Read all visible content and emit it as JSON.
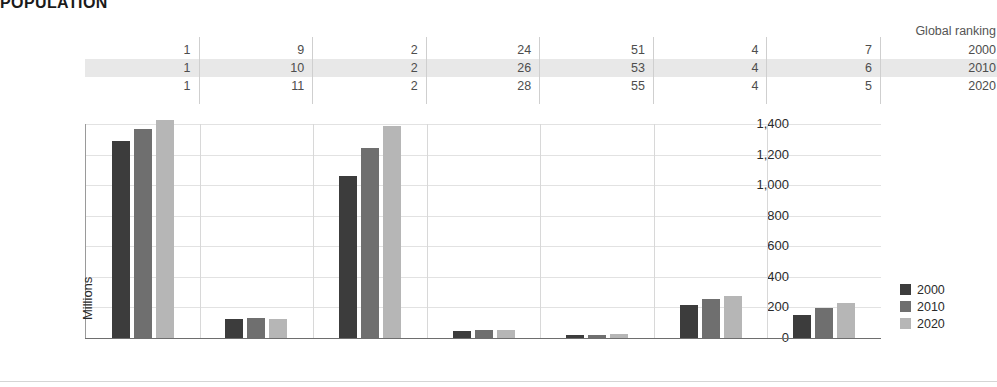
{
  "title": "POPULATION",
  "ranking_table": {
    "header_label": "Global ranking",
    "row_years": [
      "2000",
      "2010",
      "2020"
    ],
    "rows": [
      {
        "year": "2000",
        "values": [
          "1",
          "9",
          "2",
          "24",
          "51",
          "4",
          "7"
        ]
      },
      {
        "year": "2010",
        "values": [
          "1",
          "10",
          "2",
          "26",
          "53",
          "4",
          "6"
        ]
      },
      {
        "year": "2020",
        "values": [
          "1",
          "11",
          "2",
          "28",
          "55",
          "4",
          "5"
        ]
      }
    ],
    "highlighted_row_index": 1
  },
  "legend": {
    "position": "right",
    "items": [
      {
        "label": "2000",
        "color": "#3c3c3c"
      },
      {
        "label": "2010",
        "color": "#6f6f6f"
      },
      {
        "label": "2020",
        "color": "#b6b6b6"
      }
    ]
  },
  "chart_data": {
    "type": "bar",
    "title": "POPULATION",
    "xlabel": "",
    "ylabel": "Millions",
    "ylim": [
      0,
      1400
    ],
    "yticks": [
      "0",
      "200",
      "400",
      "600",
      "800",
      "1,000",
      "1,200",
      "1,400"
    ],
    "ytick_values": [
      0,
      200,
      400,
      600,
      800,
      1000,
      1200,
      1400
    ],
    "grid": true,
    "categories": [
      "China",
      "Japan",
      "India",
      "South Korea",
      "Australia",
      "Indonesia",
      "Pakistan"
    ],
    "series": [
      {
        "name": "2000",
        "color": "#3c3c3c",
        "values": [
          1290,
          127,
          1060,
          47,
          19,
          214,
          152
        ]
      },
      {
        "name": "2010",
        "color": "#6f6f6f",
        "values": [
          1370,
          128,
          1240,
          50,
          22,
          254,
          194
        ]
      },
      {
        "name": "2020",
        "color": "#b6b6b6",
        "values": [
          1425,
          126,
          1390,
          52,
          26,
          274,
          227
        ]
      }
    ]
  }
}
